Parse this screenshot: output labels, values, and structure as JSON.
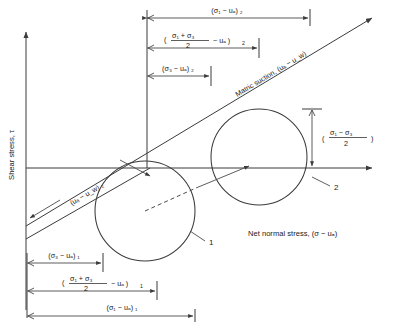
{
  "figure": {
    "type": "mohr-circle-diagram",
    "axes": {
      "y_label": "Shear stress, τ",
      "x_label": "Net normal stress, (σ − uₐ)"
    },
    "envelope_label": "Matric suction, (uₐ − u_w)",
    "suction_label": "(uₐ − u_w) ₂",
    "circles": [
      {
        "id": "1",
        "label": "1"
      },
      {
        "id": "2",
        "label": "2"
      }
    ],
    "dimensions_top": [
      {
        "name": "sigma1-minus-ua-2",
        "text": "(σ₁ − uₐ) ₂"
      },
      {
        "name": "mean-stress-2",
        "open_paren": "(",
        "numerator": "σ₁ + σ₃",
        "denominator": "2",
        "tail": "− uₐ )",
        "subscript": "2"
      },
      {
        "name": "sigma3-minus-ua-2",
        "text": "(σ₃ − uₐ) ₂"
      }
    ],
    "dimensions_bottom": [
      {
        "name": "sigma3-minus-ua-1",
        "text": "(σ₃ − uₐ) ₁"
      },
      {
        "name": "mean-stress-1",
        "open_paren": "(",
        "numerator": "σ₁ + σ₃",
        "denominator": "2",
        "tail": "− uₐ )",
        "subscript": "1"
      },
      {
        "name": "sigma1-minus-ua-1",
        "text": "(σ₁ − uₐ) ₁"
      }
    ],
    "dimension_right": {
      "name": "deviator-half-2",
      "open_paren": "(",
      "numerator": "σ₁ − σ₃",
      "denominator": "2",
      "close_paren": ")"
    },
    "colors": {
      "line": "#3b3b3b",
      "text": "#1a1a1a",
      "background": "#ffffff"
    }
  }
}
